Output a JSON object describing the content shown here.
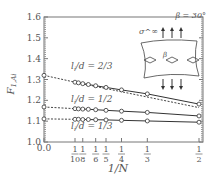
{
  "chart_data": {
    "type": "line",
    "title": "",
    "xlabel": "1/N",
    "ylabel": "F_{1,Ai}",
    "xlim": [
      0,
      0.5
    ],
    "ylim": [
      1.0,
      1.6
    ],
    "yticks": [
      "1.0",
      "1.1",
      "1.2",
      "1.3",
      "1.4",
      "1.5",
      "1.6"
    ],
    "xticks": [
      {
        "value": 0.0,
        "label": "0.0"
      },
      {
        "value": 0.1,
        "num": "1",
        "den": "10"
      },
      {
        "value": 0.125,
        "num": "1",
        "den": "8"
      },
      {
        "value": 0.1667,
        "num": "1",
        "den": "6"
      },
      {
        "value": 0.2,
        "num": "1",
        "den": "5"
      },
      {
        "value": 0.25,
        "num": "1",
        "den": "4"
      },
      {
        "value": 0.3333,
        "num": "1",
        "den": "3"
      },
      {
        "value": 0.5,
        "num": "1",
        "den": "2"
      }
    ],
    "annotation": "β = 30°",
    "inset_label": "σ^∞",
    "series": [
      {
        "name": "l_i/d=2/3",
        "x": [
          0.1,
          0.111,
          0.125,
          0.143,
          0.1667,
          0.2,
          0.25,
          0.3333,
          0.5
        ],
        "y": [
          1.287,
          1.284,
          1.28,
          1.276,
          1.27,
          1.262,
          1.25,
          1.231,
          1.182
        ],
        "extrapolation": {
          "x": [
            0,
            0.1
          ],
          "y": [
            1.32,
            1.287
          ]
        },
        "extrapolation2": {
          "x": [
            0.1,
            0.5
          ],
          "y": [
            1.287,
            1.165
          ]
        }
      },
      {
        "name": "l_i/d=1/2",
        "x": [
          0.1,
          0.111,
          0.125,
          0.143,
          0.1667,
          0.2,
          0.25,
          0.3333,
          0.5
        ],
        "y": [
          1.16,
          1.159,
          1.158,
          1.157,
          1.155,
          1.152,
          1.148,
          1.142,
          1.125
        ],
        "extrapolation": {
          "x": [
            0,
            0.1
          ],
          "y": [
            1.168,
            1.16
          ]
        }
      },
      {
        "name": "l_i/d=1/3",
        "x": [
          0.1,
          0.111,
          0.125,
          0.143,
          0.1667,
          0.2,
          0.25,
          0.3333,
          0.5
        ],
        "y": [
          1.109,
          1.109,
          1.108,
          1.108,
          1.107,
          1.106,
          1.104,
          1.101,
          1.095
        ],
        "extrapolation": {
          "x": [
            0,
            0.1
          ],
          "y": [
            1.111,
            1.109
          ]
        }
      }
    ],
    "labels": {
      "s1": {
        "pre": "l",
        "sub": "i",
        "post": "/d = 2/3"
      },
      "s2": {
        "pre": "l",
        "sub": "i",
        "post": "/d = 1/2"
      },
      "s3": {
        "pre": "l",
        "sub": "i",
        "post": "/d = 1/3"
      }
    }
  }
}
